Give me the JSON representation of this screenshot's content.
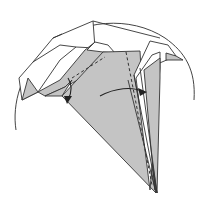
{
  "diagram": {
    "caption_cropped": "",
    "colors": {
      "paper_colored_side": "#c4c4c4",
      "paper_white_side": "#ffffff",
      "line": "#333333"
    },
    "symbols": [
      {
        "name": "valley-fold-line",
        "style": "dashed"
      },
      {
        "name": "fold-arrow-down",
        "direction": "down"
      },
      {
        "name": "swing-arrow",
        "direction": "left-to-right"
      }
    ]
  }
}
